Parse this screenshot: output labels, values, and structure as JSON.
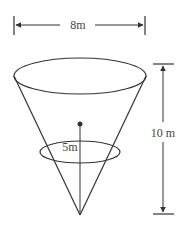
{
  "diagram": {
    "type": "inverted-cone",
    "labels": {
      "top_diameter": "8m",
      "height": "10 m",
      "water_depth": "5m"
    },
    "colors": {
      "stroke": "#333333",
      "text": "#444444",
      "background": "#ffffff"
    }
  }
}
